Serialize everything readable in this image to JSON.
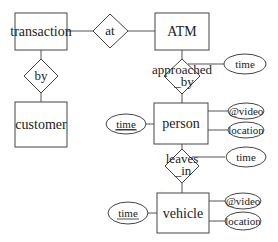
{
  "diagram": {
    "type": "entity-relationship",
    "entities": {
      "transaction": "transaction",
      "atm": "ATM",
      "customer": "customer",
      "person": "person",
      "vehicle": "vehicle"
    },
    "relationships": {
      "at": "at",
      "by": "by",
      "approached_by_line1": "approached",
      "approached_by_line2": "_by",
      "leaves_in_line1": "leaves",
      "leaves_in_line2": "_in"
    },
    "attributes": {
      "approached_by_time": "time",
      "person_time": "time",
      "person_video": "@video",
      "person_location": "location",
      "leaves_in_time": "time",
      "vehicle_time": "time",
      "vehicle_video": "@video",
      "vehicle_location": "location"
    },
    "edges": [
      [
        "transaction",
        "at"
      ],
      [
        "at",
        "ATM"
      ],
      [
        "transaction",
        "by"
      ],
      [
        "by",
        "customer"
      ],
      [
        "ATM",
        "approached_by"
      ],
      [
        "approached_by",
        "person"
      ],
      [
        "approached_by",
        "time"
      ],
      [
        "person",
        "time"
      ],
      [
        "person",
        "@video"
      ],
      [
        "person",
        "location"
      ],
      [
        "person",
        "leaves_in"
      ],
      [
        "leaves_in",
        "vehicle"
      ],
      [
        "leaves_in",
        "time"
      ],
      [
        "vehicle",
        "time"
      ],
      [
        "vehicle",
        "@video"
      ],
      [
        "vehicle",
        "location"
      ]
    ]
  }
}
